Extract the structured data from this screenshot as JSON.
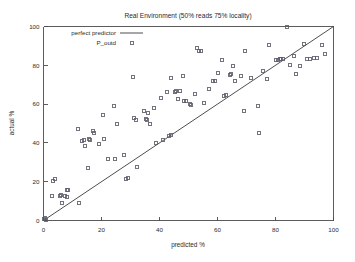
{
  "chart_data": {
    "type": "scatter",
    "title": "Real Environment (50% reads 75% locality)",
    "xlabel": "predicted %",
    "ylabel": "actual %",
    "xlim": [
      0,
      100
    ],
    "ylim": [
      0,
      100
    ],
    "xticks": [
      "0",
      "20",
      "40",
      "60",
      "80",
      "100"
    ],
    "xtick_values": [
      0,
      20,
      40,
      60,
      80,
      100
    ],
    "yticks": [
      "0",
      "20",
      "40",
      "60",
      "80",
      "100"
    ],
    "ytick_values": [
      0,
      20,
      40,
      60,
      80,
      100
    ],
    "grid": false,
    "legend_position": "top-left-inside",
    "series": [
      {
        "name": "perfect predictor",
        "type": "line",
        "style": "solid",
        "color": "#3a3a3a",
        "x": [
          0,
          100
        ],
        "values": [
          0,
          100
        ]
      },
      {
        "name": "P_outd",
        "type": "scatter",
        "marker": "square-open",
        "color": "#5a5a6a",
        "points": [
          [
            0.3,
            0.6
          ],
          [
            0.5,
            1.5
          ],
          [
            0.8,
            0.4
          ],
          [
            3.2,
            20.2
          ],
          [
            3.8,
            21.4
          ],
          [
            3.0,
            12.6
          ],
          [
            5.8,
            12.8
          ],
          [
            6.2,
            13.4
          ],
          [
            6.4,
            9.0
          ],
          [
            7.4,
            12.4
          ],
          [
            8.0,
            15.6
          ],
          [
            8.6,
            15.6
          ],
          [
            8.2,
            12.0
          ],
          [
            11.8,
            47.0
          ],
          [
            12.4,
            8.8
          ],
          [
            13.4,
            41.2
          ],
          [
            13.8,
            41.6
          ],
          [
            14.2,
            38.4
          ],
          [
            15.2,
            27.0
          ],
          [
            15.6,
            42.0
          ],
          [
            16.2,
            41.6
          ],
          [
            17.0,
            46.0
          ],
          [
            17.4,
            45.2
          ],
          [
            19.2,
            39.2
          ],
          [
            20.4,
            54.6
          ],
          [
            21.0,
            42.2
          ],
          [
            22.2,
            31.8
          ],
          [
            24.2,
            59.2
          ],
          [
            24.6,
            31.8
          ],
          [
            25.4,
            49.8
          ],
          [
            27.6,
            33.6
          ],
          [
            28.4,
            21.6
          ],
          [
            29.0,
            22.0
          ],
          [
            30.8,
            73.8
          ],
          [
            31.2,
            52.6
          ],
          [
            32.0,
            52.0
          ],
          [
            32.4,
            27.8
          ],
          [
            34.8,
            56.4
          ],
          [
            35.4,
            52.4
          ],
          [
            35.8,
            51.8
          ],
          [
            36.2,
            55.2
          ],
          [
            36.6,
            49.6
          ],
          [
            38.2,
            58.2
          ],
          [
            38.8,
            40.2
          ],
          [
            40.4,
            63.4
          ],
          [
            41.2,
            41.4
          ],
          [
            42.6,
            66.2
          ],
          [
            43.4,
            43.8
          ],
          [
            43.8,
            73.6
          ],
          [
            44.0,
            44.0
          ],
          [
            45.2,
            66.2
          ],
          [
            45.8,
            67.0
          ],
          [
            46.4,
            62.6
          ],
          [
            47.2,
            66.6
          ],
          [
            48.0,
            74.4
          ],
          [
            48.6,
            61.4
          ],
          [
            49.2,
            61.6
          ],
          [
            50.4,
            60.0
          ],
          [
            51.0,
            59.4
          ],
          [
            52.2,
            65.4
          ],
          [
            53.0,
            89.0
          ],
          [
            53.6,
            87.2
          ],
          [
            54.2,
            87.4
          ],
          [
            55.4,
            60.4
          ],
          [
            57.2,
            68.0
          ],
          [
            58.4,
            71.8
          ],
          [
            59.0,
            72.0
          ],
          [
            60.2,
            76.2
          ],
          [
            61.6,
            82.6
          ],
          [
            62.4,
            64.2
          ],
          [
            63.0,
            64.8
          ],
          [
            64.2,
            74.8
          ],
          [
            64.8,
            75.4
          ],
          [
            65.4,
            79.6
          ],
          [
            66.0,
            71.8
          ],
          [
            68.2,
            74.6
          ],
          [
            69.0,
            56.4
          ],
          [
            69.6,
            87.2
          ],
          [
            71.4,
            73.2
          ],
          [
            73.8,
            58.8
          ],
          [
            74.2,
            45.0
          ],
          [
            75.6,
            77.0
          ],
          [
            77.2,
            72.8
          ],
          [
            77.6,
            90.6
          ],
          [
            80.2,
            82.8
          ],
          [
            80.8,
            82.8
          ],
          [
            81.4,
            83.0
          ],
          [
            82.0,
            83.2
          ],
          [
            82.6,
            83.4
          ],
          [
            84.0,
            100.0
          ],
          [
            85.0,
            80.2
          ],
          [
            86.4,
            84.8
          ],
          [
            87.2,
            75.4
          ],
          [
            88.6,
            79.6
          ],
          [
            89.8,
            91.2
          ],
          [
            91.0,
            83.2
          ],
          [
            92.0,
            83.4
          ],
          [
            93.2,
            83.6
          ],
          [
            94.4,
            84.0
          ],
          [
            96.2,
            90.6
          ],
          [
            97.0,
            85.6
          ]
        ]
      }
    ]
  },
  "legend": {
    "items": [
      {
        "label": "perfect predictor",
        "symbol": "line"
      },
      {
        "label": "P_outd",
        "symbol": "square"
      }
    ]
  }
}
